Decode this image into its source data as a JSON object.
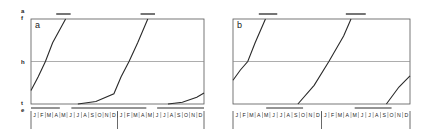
{
  "chart_data": [
    {
      "type": "line",
      "panel_label": "a",
      "title": "",
      "xlabel": "",
      "ylabel": "",
      "y_ticks": [
        "a",
        "f",
        "h",
        "t",
        "e"
      ],
      "month_labels": [
        "J",
        "F",
        "M",
        "A",
        "M",
        "J",
        "J",
        "A",
        "S",
        "O",
        "N",
        "D",
        "J",
        "F",
        "M",
        "A",
        "M",
        "J",
        "J",
        "A",
        "S",
        "O",
        "N",
        "D"
      ],
      "years": 2,
      "reference_lines": [
        {
          "label": "h",
          "y_fraction": 0.5
        }
      ],
      "bars_above": [
        {
          "x_start_month": 3.5,
          "x_end_month": 5.5
        },
        {
          "x_start_month": 15.2,
          "x_end_month": 17.2
        }
      ],
      "bars_below": [
        {
          "x_start_month": 0,
          "x_end_month": 4.0
        },
        {
          "x_start_month": 5.6,
          "x_end_month": 16.0
        },
        {
          "x_start_month": 17.5,
          "x_end_month": 24
        }
      ],
      "series": [
        {
          "name": "curve-1",
          "points": [
            [
              0,
              0.16
            ],
            [
              1,
              0.32
            ],
            [
              2,
              0.5
            ],
            [
              3,
              0.72
            ],
            [
              4.8,
              1.0
            ]
          ]
        },
        {
          "name": "curve-2",
          "points": [
            [
              6.5,
              0.0
            ],
            [
              9,
              0.03
            ],
            [
              11.5,
              0.12
            ],
            [
              12.5,
              0.32
            ],
            [
              13.6,
              0.5
            ],
            [
              14.8,
              0.72
            ],
            [
              16.2,
              1.0
            ]
          ]
        },
        {
          "name": "curve-3",
          "points": [
            [
              19,
              0.0
            ],
            [
              21,
              0.02
            ],
            [
              23,
              0.08
            ],
            [
              24,
              0.13
            ]
          ]
        }
      ],
      "ylim": [
        0,
        1
      ],
      "xlim": [
        0,
        24
      ]
    },
    {
      "type": "line",
      "panel_label": "b",
      "title": "",
      "xlabel": "",
      "ylabel": "",
      "y_ticks": [],
      "month_labels": [
        "J",
        "F",
        "M",
        "A",
        "M",
        "J",
        "J",
        "A",
        "S",
        "O",
        "N",
        "D",
        "J",
        "F",
        "M",
        "A",
        "M",
        "J",
        "J",
        "A",
        "S",
        "O",
        "N",
        "D"
      ],
      "years": 2,
      "reference_lines": [
        {
          "label": "h",
          "y_fraction": 0.5
        }
      ],
      "bars_above": [
        {
          "x_start_month": 3.5,
          "x_end_month": 6.0
        },
        {
          "x_start_month": 15.3,
          "x_end_month": 18.0
        }
      ],
      "bars_below": [
        {
          "x_start_month": 4.5,
          "x_end_month": 9.5
        },
        {
          "x_start_month": 16.5,
          "x_end_month": 21.5
        }
      ],
      "series": [
        {
          "name": "curve-1",
          "points": [
            [
              0,
              0.28
            ],
            [
              1,
              0.4
            ],
            [
              2,
              0.5
            ],
            [
              3,
              0.72
            ],
            [
              4.4,
              1.0
            ]
          ]
        },
        {
          "name": "curve-2",
          "points": [
            [
              8.8,
              0.0
            ],
            [
              11,
              0.22
            ],
            [
              13,
              0.5
            ],
            [
              15,
              0.8
            ],
            [
              16,
              1.0
            ]
          ]
        },
        {
          "name": "curve-3",
          "points": [
            [
              20.8,
              0.0
            ],
            [
              22.5,
              0.2
            ],
            [
              24,
              0.33
            ]
          ]
        }
      ],
      "ylim": [
        0,
        1
      ],
      "xlim": [
        0,
        24
      ]
    }
  ],
  "panels": {
    "a": {
      "label": "a"
    },
    "b": {
      "label": "b"
    }
  },
  "y_axis": {
    "a": "a",
    "f": "f",
    "h": "h",
    "t": "t",
    "e": "e"
  },
  "months": "J|F|M|A|M|J|J|A|S|O|N|D"
}
